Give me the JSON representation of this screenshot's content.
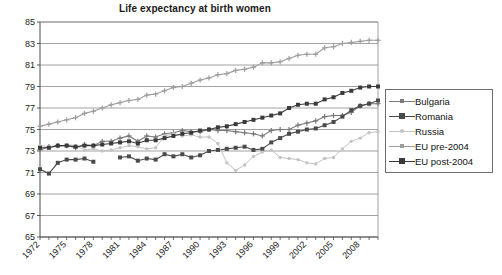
{
  "chart_data": {
    "type": "line",
    "title": "Life expectancy at birth women",
    "xlabel": "",
    "ylabel": "",
    "ylim": [
      65,
      85
    ],
    "ytick_step": 2,
    "yticks": [
      65,
      67,
      69,
      71,
      73,
      75,
      77,
      79,
      81,
      83,
      85
    ],
    "xlim": [
      1972,
      2010
    ],
    "xticks_labeled": [
      1972,
      1975,
      1978,
      1981,
      1984,
      1987,
      1990,
      1993,
      1996,
      1999,
      2002,
      2005,
      2008
    ],
    "xtick_step": 1,
    "grid": "horizontal",
    "legend_position": "right",
    "x": [
      1972,
      1973,
      1974,
      1975,
      1976,
      1977,
      1978,
      1979,
      1980,
      1981,
      1982,
      1983,
      1984,
      1985,
      1986,
      1987,
      1988,
      1989,
      1990,
      1991,
      1992,
      1993,
      1994,
      1995,
      1996,
      1997,
      1998,
      1999,
      2000,
      2001,
      2002,
      2003,
      2004,
      2005,
      2006,
      2007,
      2008,
      2009,
      2010
    ],
    "series": [
      {
        "name": "Bulgaria",
        "color": "#7a7a7a",
        "marker": "plus",
        "values": [
          73.1,
          73.4,
          73.5,
          73.5,
          73.3,
          73.6,
          73.5,
          73.9,
          73.9,
          74.2,
          74.4,
          73.9,
          74.4,
          74.3,
          74.6,
          74.7,
          74.9,
          74.8,
          74.8,
          75.0,
          74.9,
          74.9,
          74.8,
          74.7,
          74.6,
          74.4,
          74.9,
          75.0,
          75.0,
          75.4,
          75.6,
          75.8,
          76.2,
          76.3,
          76.3,
          76.6,
          77.2,
          77.4,
          77.4
        ]
      },
      {
        "name": "Romania",
        "color": "#4a4a4a",
        "marker": "square-filled",
        "values": [
          71.3,
          70.9,
          71.9,
          72.2,
          72.2,
          72.3,
          72.0,
          null,
          null,
          72.4,
          72.5,
          72.1,
          72.3,
          72.2,
          72.7,
          72.5,
          72.7,
          72.4,
          72.6,
          73.0,
          73.1,
          73.2,
          73.3,
          73.4,
          73.1,
          73.2,
          73.8,
          74.2,
          74.6,
          74.8,
          75.0,
          75.1,
          75.4,
          75.7,
          76.2,
          76.8,
          77.2,
          77.4,
          77.7
        ]
      },
      {
        "name": "Russia",
        "color": "#c3c3c3",
        "marker": "dot",
        "values": [
          73.5,
          73.4,
          73.4,
          73.6,
          73.5,
          73.1,
          73.2,
          73.0,
          73.1,
          73.3,
          73.5,
          73.4,
          73.2,
          73.3,
          74.4,
          74.6,
          74.4,
          74.5,
          74.3,
          74.3,
          73.7,
          71.9,
          71.2,
          71.7,
          72.5,
          72.9,
          73.1,
          72.4,
          72.3,
          72.2,
          71.9,
          71.8,
          72.3,
          72.4,
          73.2,
          73.9,
          74.2,
          74.7,
          74.8
        ]
      },
      {
        "name": "EU pre-2004",
        "color": "#9e9e9e",
        "marker": "plus",
        "values": [
          75.3,
          75.5,
          75.7,
          75.9,
          76.1,
          76.5,
          76.7,
          77.0,
          77.3,
          77.5,
          77.7,
          77.8,
          78.2,
          78.3,
          78.6,
          78.9,
          79.0,
          79.3,
          79.6,
          79.8,
          80.1,
          80.2,
          80.5,
          80.6,
          80.8,
          81.2,
          81.2,
          81.3,
          81.6,
          81.9,
          82.0,
          82.0,
          82.6,
          82.7,
          83.0,
          83.1,
          83.2,
          83.3,
          83.3
        ]
      },
      {
        "name": "EU post-2004",
        "color": "#3a3a3a",
        "marker": "square-filled",
        "values": [
          73.3,
          73.3,
          73.5,
          73.5,
          73.4,
          73.5,
          73.5,
          73.6,
          73.7,
          73.8,
          73.9,
          73.7,
          74.0,
          74.0,
          74.2,
          74.4,
          74.6,
          74.7,
          74.9,
          75.0,
          75.2,
          75.3,
          75.5,
          75.7,
          75.9,
          76.1,
          76.3,
          76.5,
          77.0,
          77.3,
          77.4,
          77.4,
          77.8,
          78.0,
          78.4,
          78.6,
          78.9,
          79.0,
          79.0
        ]
      }
    ]
  },
  "legend": {
    "items": [
      {
        "label": "Bulgaria"
      },
      {
        "label": "Romania"
      },
      {
        "label": "Russia"
      },
      {
        "label": "EU pre-2004"
      },
      {
        "label": "EU post-2004"
      }
    ]
  }
}
